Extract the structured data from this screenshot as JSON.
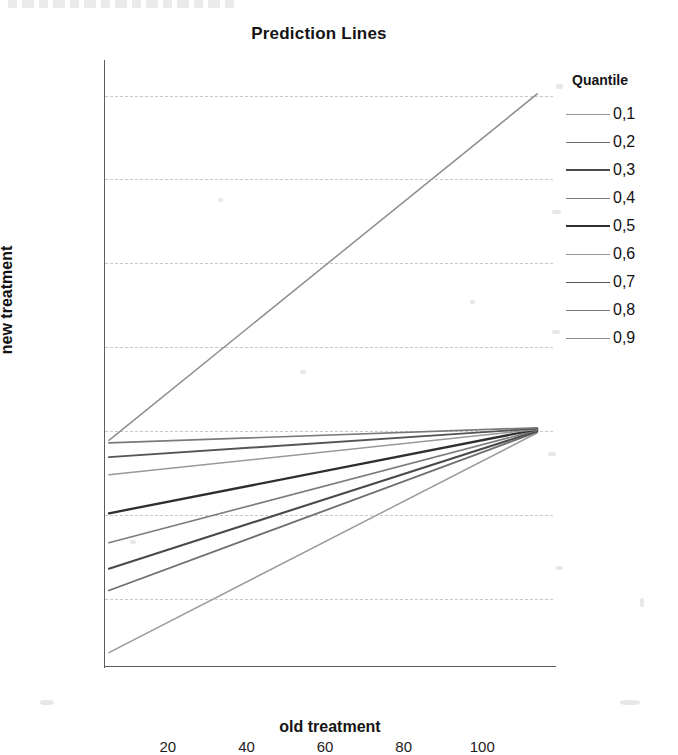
{
  "chart_data": {
    "type": "line",
    "title": "Prediction Lines",
    "xlabel": "old treatment",
    "ylabel": "new treatment",
    "xlim": [
      4,
      118
    ],
    "ylim": [
      12,
      84
    ],
    "xticks": [
      20,
      40,
      60,
      80,
      100
    ],
    "yticks": [
      20,
      30,
      40,
      50,
      60,
      70,
      80
    ],
    "grid": true,
    "legend_title": "Quantile",
    "legend_position": "right",
    "x": [
      5,
      114
    ],
    "series": [
      {
        "name": "0,1",
        "values": [
          13.6,
          39.8
        ],
        "color": "#9a9a9a"
      },
      {
        "name": "0,2",
        "values": [
          21.0,
          39.9
        ],
        "color": "#6f6f6f"
      },
      {
        "name": "0,3",
        "values": [
          23.6,
          40.0
        ],
        "color": "#4a4a4a"
      },
      {
        "name": "0,4",
        "values": [
          26.7,
          40.1
        ],
        "color": "#7c7c7c"
      },
      {
        "name": "0,5",
        "values": [
          30.2,
          40.2
        ],
        "color": "#2e2e2e"
      },
      {
        "name": "0,6",
        "values": [
          34.8,
          40.2
        ],
        "color": "#989898"
      },
      {
        "name": "0,7",
        "values": [
          36.9,
          40.3
        ],
        "color": "#555555"
      },
      {
        "name": "0,8",
        "values": [
          38.6,
          40.4
        ],
        "color": "#7a7a7a"
      },
      {
        "name": "0,9",
        "values": [
          38.9,
          80.2
        ],
        "color": "#8d8d8d"
      }
    ]
  },
  "axis": {
    "ytick_labels": [
      "80",
      "70",
      "60",
      "50",
      "40",
      "30",
      "20"
    ],
    "xtick_labels": [
      "20",
      "40",
      "60",
      "80",
      "100"
    ]
  },
  "legend": {
    "title": "Quantile",
    "items": [
      {
        "label": "0,1"
      },
      {
        "label": "0,2"
      },
      {
        "label": "0,3"
      },
      {
        "label": "0,4"
      },
      {
        "label": "0,5"
      },
      {
        "label": "0,6"
      },
      {
        "label": "0,7"
      },
      {
        "label": "0,8"
      },
      {
        "label": "0,9"
      }
    ]
  }
}
